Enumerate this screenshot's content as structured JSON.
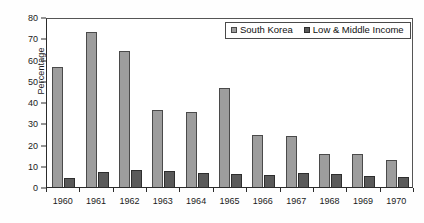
{
  "chart_data": {
    "type": "bar",
    "title": "",
    "subtitle": "",
    "xlabel": "",
    "ylabel": "Percentage",
    "ylim": [
      0,
      80
    ],
    "ytick_step": 10,
    "yticks": [
      0,
      10,
      20,
      30,
      40,
      50,
      60,
      70,
      80
    ],
    "grid": false,
    "legend_position": "top-right",
    "categories": [
      "1960",
      "1961",
      "1962",
      "1963",
      "1964",
      "1965",
      "1966",
      "1967",
      "1968",
      "1969",
      "1970"
    ],
    "series": [
      {
        "name": "South Korea",
        "color": "#9d9d9d",
        "values": [
          56.5,
          72.8,
          64.2,
          36.1,
          35.3,
          46.6,
          24.3,
          24.0,
          15.7,
          15.5,
          12.6
        ]
      },
      {
        "name": "Low & Middle Income",
        "color": "#5a5a5a",
        "values": [
          4.3,
          7.0,
          8.2,
          7.7,
          6.6,
          6.1,
          5.6,
          6.5,
          6.1,
          5.2,
          4.8
        ]
      }
    ]
  },
  "legend": {
    "entries": [
      {
        "label": "South Korea"
      },
      {
        "label": "Low & Middle Income"
      }
    ]
  },
  "axes": {
    "y_title": "Percentage"
  }
}
